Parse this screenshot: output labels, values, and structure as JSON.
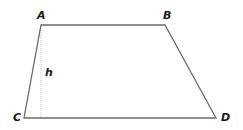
{
  "diagram": {
    "type": "trapezoid",
    "vertices": {
      "A": {
        "label": "A",
        "x": 41,
        "y": 25
      },
      "B": {
        "label": "B",
        "x": 165,
        "y": 25
      },
      "C": {
        "label": "C",
        "x": 24,
        "y": 118
      },
      "D": {
        "label": "D",
        "x": 216,
        "y": 118
      }
    },
    "height_label": "h",
    "colors": {
      "stroke": "#6b6b6b",
      "height_line": "#c8c8c8",
      "label": "#1a1a1a"
    }
  }
}
